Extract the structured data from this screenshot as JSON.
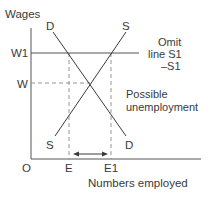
{
  "diagram": {
    "type": "labour-market-supply-demand",
    "axes": {
      "y_label": "Wages",
      "x_label": "Numbers employed",
      "origin_label": "O"
    },
    "wage_levels": [
      {
        "id": "W1",
        "label": "W1",
        "style": "solid"
      },
      {
        "id": "W",
        "label": "W",
        "style": "dashed"
      }
    ],
    "employment_levels": [
      {
        "id": "E",
        "label": "E"
      },
      {
        "id": "E1",
        "label": "E1"
      }
    ],
    "curves": {
      "demand": {
        "top_label": "D",
        "bottom_label": "D"
      },
      "supply": {
        "top_label": "S",
        "bottom_label": "S"
      }
    },
    "annotations": {
      "omit_line1": "Omit",
      "omit_line2": "line S1",
      "omit_line3": "–S1",
      "unemployment_line1": "Possible",
      "unemployment_line2": "unemployment"
    },
    "colors": {
      "line": "#3a3a3a",
      "dashed": "#8a8a8a",
      "text": "#3a3a3a",
      "background": "#ffffff"
    }
  }
}
